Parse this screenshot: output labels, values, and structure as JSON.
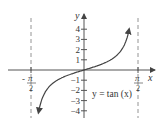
{
  "chart_data": {
    "type": "line",
    "title": "",
    "function_label": "y = tan (x)",
    "xlabel": "x",
    "ylabel": "y",
    "x_ticks": [
      {
        "num": "π",
        "den": "2",
        "sign": "-",
        "value": -1.5708
      },
      {
        "num": "π",
        "den": "2",
        "sign": "",
        "value": 1.5708
      }
    ],
    "y_ticks": [
      "4",
      "3",
      "2",
      "1",
      "-1",
      "-2",
      "-3",
      "-4"
    ],
    "ylim": [
      -4.5,
      4.5
    ],
    "xlim": [
      -1.5708,
      1.5708
    ],
    "asymptotes": [
      -1.5708,
      1.5708
    ],
    "series": [
      {
        "name": "y = tan(x)",
        "x": [
          -1.33,
          -1.2,
          -1.0,
          -0.8,
          -0.6,
          -0.4,
          -0.2,
          0,
          0.2,
          0.4,
          0.6,
          0.8,
          1.0,
          1.2,
          1.33
        ],
        "values": [
          -4.2,
          -2.57,
          -1.56,
          -1.03,
          -0.68,
          -0.42,
          -0.2,
          0,
          0.2,
          0.42,
          0.68,
          1.03,
          1.56,
          2.57,
          4.2
        ]
      }
    ],
    "grid": false,
    "legend": "none"
  },
  "colors": {
    "curve": "#444444",
    "axis": "#555555",
    "asymptote": "#888888",
    "text": "#333333"
  }
}
